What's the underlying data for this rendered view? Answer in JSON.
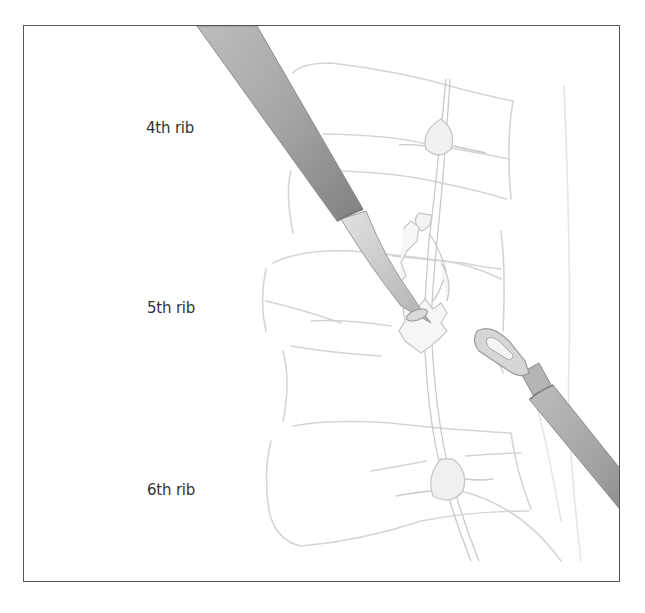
{
  "figure": {
    "labels": {
      "rib4": "4th rib",
      "rib5": "5th rib",
      "rib6": "6th rib"
    },
    "elements": {
      "left_instrument": "endoscopic-suction-tube",
      "right_instrument": "endoscopic-hook-probe",
      "structure": "sympathetic-chain-ganglia"
    },
    "colors": {
      "frame": "#555555",
      "label_text": "#333333",
      "rib_outline": "#d0d0d0",
      "instrument_fill": "#9a9a9a",
      "instrument_highlight": "#c8c8c8"
    }
  }
}
